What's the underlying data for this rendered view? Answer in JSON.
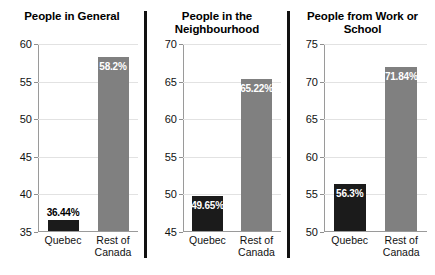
{
  "chart_data": [
    {
      "type": "bar",
      "title": "People in\nGeneral",
      "categories": [
        "Quebec",
        "Rest of\nCanada"
      ],
      "values": [
        36.44,
        58.2
      ],
      "labels": [
        "36.44%",
        "58.2%"
      ],
      "label_positions": [
        "above",
        "inside"
      ],
      "bar_colors": [
        "#1b1b1b",
        "#808080"
      ],
      "xlabel": "",
      "ylabel": "",
      "ylim": [
        35,
        60
      ],
      "yticks": [
        35,
        40,
        45,
        50,
        55,
        60
      ],
      "ytick_labels": [
        "35",
        "40",
        "45",
        "50",
        "55",
        "60"
      ],
      "grid": true,
      "legend": "none"
    },
    {
      "type": "bar",
      "title": "People in the\nNeighbourhood",
      "categories": [
        "Quebec",
        "Rest of\nCanada"
      ],
      "values": [
        49.65,
        65.22
      ],
      "labels": [
        "49.65%",
        "65.22%"
      ],
      "label_positions": [
        "inside",
        "inside"
      ],
      "bar_colors": [
        "#1b1b1b",
        "#808080"
      ],
      "xlabel": "",
      "ylabel": "",
      "ylim": [
        45,
        70
      ],
      "yticks": [
        45,
        50,
        55,
        60,
        65,
        70
      ],
      "ytick_labels": [
        "45",
        "50",
        "55",
        "60",
        "65",
        "70"
      ],
      "grid": true,
      "legend": "none"
    },
    {
      "type": "bar",
      "title": "People from\nWork or School",
      "categories": [
        "Quebec",
        "Rest of\nCanada"
      ],
      "values": [
        56.3,
        71.84
      ],
      "labels": [
        "56.3%",
        "71.84%"
      ],
      "label_positions": [
        "inside",
        "inside"
      ],
      "bar_colors": [
        "#1b1b1b",
        "#808080"
      ],
      "xlabel": "",
      "ylabel": "",
      "ylim": [
        50,
        75
      ],
      "yticks": [
        50,
        55,
        60,
        65,
        70,
        75
      ],
      "ytick_labels": [
        "50",
        "55",
        "60",
        "65",
        "70",
        "75"
      ],
      "grid": true,
      "legend": "none"
    }
  ],
  "colors": {
    "bar_quebec": "#1b1b1b",
    "bar_rest_of_canada": "#808080",
    "gridline": "#e2e2e2",
    "axis": "#9a9a9a",
    "separator": "#111111",
    "background": "#ffffff"
  }
}
